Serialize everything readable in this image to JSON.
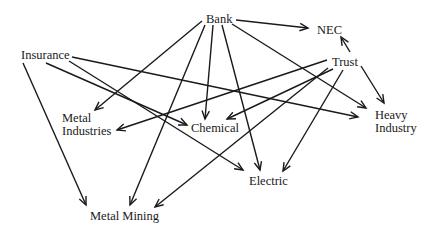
{
  "nodes": {
    "bank": {
      "label": "Bank",
      "x": 206,
      "y": 13
    },
    "nec": {
      "label": "NEC",
      "x": 317,
      "y": 24
    },
    "insurance": {
      "label": "Insurance",
      "x": 21,
      "y": 49
    },
    "trust": {
      "label": "Trust",
      "x": 332,
      "y": 56
    },
    "metal_industries": {
      "label1": "Metal",
      "label2": "Industries",
      "x": 62,
      "y": 112
    },
    "chemical": {
      "label": "Chemical",
      "x": 190,
      "y": 122
    },
    "heavy_industry": {
      "label1": "Heavy",
      "label2": "Industry",
      "x": 375,
      "y": 109
    },
    "electric": {
      "label": "Electric",
      "x": 249,
      "y": 175
    },
    "metal_mining": {
      "label": "Metal Mining",
      "x": 90,
      "y": 210
    }
  },
  "edges": [
    {
      "from": "Bank",
      "to": "NEC",
      "x1": 236,
      "y1": 20,
      "x2": 308,
      "y2": 28
    },
    {
      "from": "Bank",
      "to": "Metal Industries",
      "x1": 202,
      "y1": 21,
      "x2": 95,
      "y2": 110
    },
    {
      "from": "Bank",
      "to": "Chemical",
      "x1": 213,
      "y1": 25,
      "x2": 205,
      "y2": 119
    },
    {
      "from": "Bank",
      "to": "Metal Mining",
      "x1": 205,
      "y1": 25,
      "x2": 130,
      "y2": 205
    },
    {
      "from": "Bank",
      "to": "Electric",
      "x1": 222,
      "y1": 25,
      "x2": 260,
      "y2": 170
    },
    {
      "from": "Bank",
      "to": "Heavy Industry",
      "x1": 232,
      "y1": 24,
      "x2": 366,
      "y2": 108
    },
    {
      "from": "Trust",
      "to": "NEC",
      "x1": 350,
      "y1": 52,
      "x2": 341,
      "y2": 37
    },
    {
      "from": "Trust",
      "to": "Heavy Industry",
      "x1": 361,
      "y1": 66,
      "x2": 384,
      "y2": 103
    },
    {
      "from": "Trust",
      "to": "Metal Industries",
      "x1": 327,
      "y1": 60,
      "x2": 117,
      "y2": 130
    },
    {
      "from": "Trust",
      "to": "Chemical",
      "x1": 333,
      "y1": 69,
      "x2": 227,
      "y2": 119
    },
    {
      "from": "Trust",
      "to": "Metal Mining",
      "x1": 328,
      "y1": 68,
      "x2": 155,
      "y2": 207
    },
    {
      "from": "Trust",
      "to": "Electric",
      "x1": 343,
      "y1": 70,
      "x2": 283,
      "y2": 171
    },
    {
      "from": "Insurance",
      "to": "Metal Mining",
      "x1": 23,
      "y1": 63,
      "x2": 86,
      "y2": 205
    },
    {
      "from": "Insurance",
      "to": "Chemical",
      "x1": 46,
      "y1": 63,
      "x2": 187,
      "y2": 125
    },
    {
      "from": "Insurance",
      "to": "Electric",
      "x1": 69,
      "y1": 61,
      "x2": 243,
      "y2": 170
    },
    {
      "from": "Insurance",
      "to": "Heavy Industry",
      "x1": 72,
      "y1": 57,
      "x2": 358,
      "y2": 117
    }
  ]
}
